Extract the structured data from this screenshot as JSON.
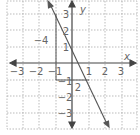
{
  "graph": {
    "equation_visible": false,
    "x_axis_label": "x",
    "y_axis_label": "y",
    "x_ticks": [
      {
        "value": -3,
        "label": "−3"
      },
      {
        "value": -2,
        "label": "−2"
      },
      {
        "value": -1,
        "label": "−1"
      },
      {
        "value": 1,
        "label": "1"
      },
      {
        "value": 2,
        "label": "2"
      },
      {
        "value": 3,
        "label": "3"
      }
    ],
    "y_ticks": [
      {
        "value": 3,
        "label": "3"
      },
      {
        "value": 2,
        "label": "2"
      },
      {
        "value": 1,
        "label": "1"
      },
      {
        "value": -1,
        "label": "−1"
      },
      {
        "value": -2,
        "label": "−2"
      },
      {
        "value": -3,
        "label": "−3"
      }
    ],
    "rise_label": "−4",
    "run_label": "2",
    "line_color": "#555555",
    "grid_color": "#aaaaaa"
  }
}
